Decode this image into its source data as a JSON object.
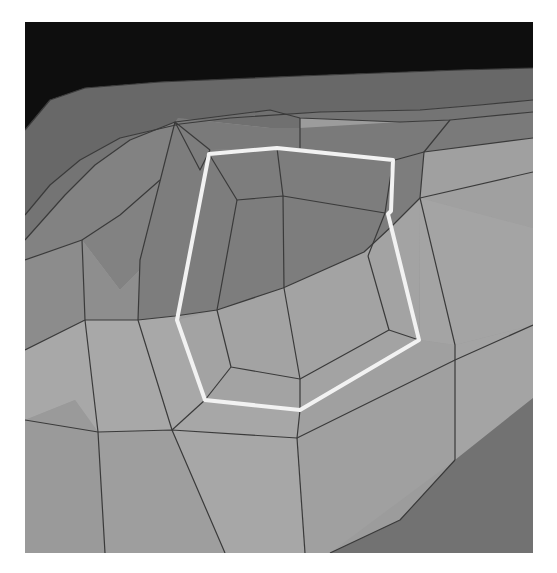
{
  "scene": {
    "description": "Grayscale 3D polygon mesh render with a highlighted white closed outline",
    "frame": {
      "x": 25,
      "y": 22,
      "width": 508,
      "height": 531
    },
    "colors": {
      "background": "#ffffff",
      "sky": "#0e0e0e",
      "band_dark": "#6c6c6c",
      "band_mid": "#7a7a7a",
      "shadow": "#7e7e7e",
      "surface": "#9a9a9a",
      "surface_light": "#a6a6a6",
      "bottom_dark": "#727272",
      "edge": "#3a3a3a",
      "outline": "#f2f2f2"
    },
    "highlight_outline": {
      "points": [
        [
          209,
          154
        ],
        [
          277,
          148
        ],
        [
          393,
          160
        ],
        [
          391,
          211
        ],
        [
          388,
          214
        ],
        [
          419,
          340
        ],
        [
          300,
          410
        ],
        [
          205,
          400
        ],
        [
          177,
          320
        ],
        [
          209,
          154
        ]
      ]
    }
  }
}
